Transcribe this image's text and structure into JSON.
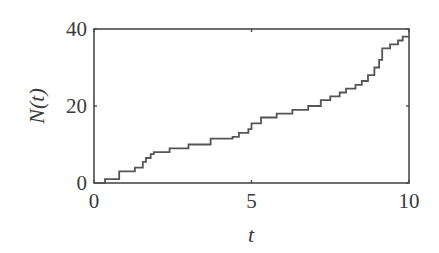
{
  "chart_data": {
    "type": "line",
    "subtype": "step",
    "title": "",
    "xlabel": "t",
    "ylabel": "N(t)",
    "xlim": [
      0,
      10
    ],
    "ylim": [
      0,
      40
    ],
    "xticks": [
      0,
      5,
      10
    ],
    "yticks": [
      0,
      20,
      40
    ],
    "xtick_labels": [
      "0",
      "5",
      "10"
    ],
    "ytick_labels": [
      "0",
      "20",
      "40"
    ],
    "grid": false,
    "legend": null,
    "series": [
      {
        "name": "N(t)",
        "color": "#555555",
        "step_times": [
          0.35,
          0.8,
          1.3,
          1.55,
          1.65,
          1.8,
          1.9,
          2.4,
          3.0,
          3.7,
          4.4,
          4.6,
          4.9,
          5.0,
          5.3,
          5.8,
          6.3,
          6.8,
          7.2,
          7.5,
          7.8,
          8.0,
          8.3,
          8.5,
          8.7,
          8.9,
          9.05,
          9.15,
          9.4,
          9.65,
          9.8
        ],
        "x": [
          0,
          0.35,
          0.8,
          1.3,
          1.55,
          1.65,
          1.8,
          1.9,
          2.4,
          3.0,
          3.7,
          4.4,
          4.6,
          4.9,
          5.0,
          5.3,
          5.8,
          6.3,
          6.8,
          7.2,
          7.5,
          7.8,
          8.0,
          8.3,
          8.5,
          8.7,
          8.9,
          9.05,
          9.15,
          9.4,
          9.65,
          9.8,
          10
        ],
        "y": [
          0,
          1,
          3,
          4,
          5.5,
          6.5,
          7.5,
          8,
          9,
          10,
          11.5,
          12,
          13,
          14,
          15.5,
          17,
          18,
          19,
          20,
          21.5,
          22.5,
          23.5,
          24.5,
          25.5,
          26.5,
          28,
          30,
          32,
          35,
          36,
          37,
          38,
          38
        ]
      }
    ]
  },
  "axes": {
    "x_label": "t",
    "y_label": "N(t)",
    "x_ticks": [
      {
        "label": "0",
        "value": 0
      },
      {
        "label": "5",
        "value": 5
      },
      {
        "label": "10",
        "value": 10
      }
    ],
    "y_ticks": [
      {
        "label": "0",
        "value": 0
      },
      {
        "label": "20",
        "value": 20
      },
      {
        "label": "40",
        "value": 40
      }
    ]
  }
}
